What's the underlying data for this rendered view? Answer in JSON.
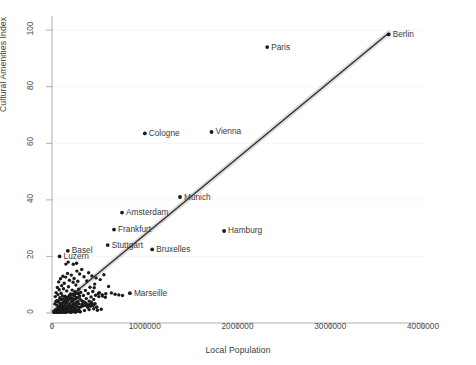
{
  "chart_data": {
    "type": "scatter",
    "title": "",
    "xlabel": "Local Population",
    "ylabel": "Cultural Amenities Index",
    "xlim": [
      0,
      4000000
    ],
    "ylim": [
      0,
      105
    ],
    "xticks": [
      0,
      1000000,
      2000000,
      3000000,
      4000000
    ],
    "xtick_labels": [
      "0",
      "1000000",
      "2000000",
      "3000000",
      "4000000"
    ],
    "yticks": [
      0,
      20,
      40,
      60,
      80,
      100
    ],
    "ytick_labels": [
      "0",
      "20",
      "40",
      "60",
      "80",
      "100"
    ],
    "grid": "horizontal-faint",
    "legend": "none",
    "marker_color": "#1a1a1a",
    "line_color": "#2b2b2b",
    "band_color": "#bfbfbf",
    "fit": {
      "type": "linear-regression-with-confidence-band",
      "x_start": 0,
      "y_start": 0.5,
      "x_end": 3630000,
      "y_end": 99.0
    },
    "labeled_points": [
      {
        "name": "Berlin",
        "x": 3630000,
        "y": 98.5,
        "label_side": "right"
      },
      {
        "name": "Paris",
        "x": 2320000,
        "y": 94.0,
        "label_side": "right"
      },
      {
        "name": "Vienna",
        "x": 1720000,
        "y": 64.0,
        "label_side": "right"
      },
      {
        "name": "Cologne",
        "x": 1000000,
        "y": 63.5,
        "label_side": "right"
      },
      {
        "name": "Munich",
        "x": 1380000,
        "y": 41.0,
        "label_side": "right"
      },
      {
        "name": "Amsterdam",
        "x": 755000,
        "y": 35.5,
        "label_side": "right"
      },
      {
        "name": "Hamburg",
        "x": 1855000,
        "y": 29.0,
        "label_side": "right"
      },
      {
        "name": "Frankfurt",
        "x": 668000,
        "y": 29.5,
        "label_side": "right"
      },
      {
        "name": "Stuttgart",
        "x": 600000,
        "y": 24.0,
        "label_side": "right"
      },
      {
        "name": "Bruxelles",
        "x": 1080000,
        "y": 22.5,
        "label_side": "right"
      },
      {
        "name": "Basel",
        "x": 170000,
        "y": 22.0,
        "label_side": "right"
      },
      {
        "name": "Luzern",
        "x": 82000,
        "y": 20.0,
        "label_side": "right"
      },
      {
        "name": "Marseille",
        "x": 840000,
        "y": 7.0,
        "label_side": "right"
      }
    ],
    "unlabeled_points": [
      [
        25000,
        0.4
      ],
      [
        32000,
        0.6
      ],
      [
        41000,
        0.9
      ],
      [
        48000,
        0.3
      ],
      [
        55000,
        1.2
      ],
      [
        60000,
        0.5
      ],
      [
        66000,
        1.6
      ],
      [
        70000,
        0.8
      ],
      [
        74000,
        2.1
      ],
      [
        80000,
        0.4
      ],
      [
        86000,
        1.1
      ],
      [
        90000,
        2.6
      ],
      [
        95000,
        0.7
      ],
      [
        100000,
        1.9
      ],
      [
        105000,
        3.1
      ],
      [
        110000,
        0.6
      ],
      [
        115000,
        1.4
      ],
      [
        120000,
        2.3
      ],
      [
        125000,
        0.9
      ],
      [
        130000,
        4.0
      ],
      [
        135000,
        1.7
      ],
      [
        140000,
        2.9
      ],
      [
        145000,
        0.5
      ],
      [
        150000,
        1.3
      ],
      [
        155000,
        3.6
      ],
      [
        160000,
        2.2
      ],
      [
        165000,
        1.0
      ],
      [
        170000,
        4.6
      ],
      [
        175000,
        2.7
      ],
      [
        180000,
        1.5
      ],
      [
        185000,
        3.3
      ],
      [
        190000,
        0.8
      ],
      [
        195000,
        2.4
      ],
      [
        200000,
        5.2
      ],
      [
        205000,
        1.8
      ],
      [
        210000,
        3.9
      ],
      [
        215000,
        2.6
      ],
      [
        220000,
        1.1
      ],
      [
        225000,
        4.3
      ],
      [
        230000,
        3.0
      ],
      [
        235000,
        2.0
      ],
      [
        240000,
        6.1
      ],
      [
        245000,
        3.5
      ],
      [
        250000,
        1.6
      ],
      [
        255000,
        4.9
      ],
      [
        260000,
        2.8
      ],
      [
        265000,
        3.7
      ],
      [
        270000,
        5.5
      ],
      [
        275000,
        2.2
      ],
      [
        280000,
        4.1
      ],
      [
        285000,
        6.8
      ],
      [
        290000,
        3.2
      ],
      [
        295000,
        1.9
      ],
      [
        300000,
        5.0
      ],
      [
        310000,
        7.3
      ],
      [
        320000,
        4.4
      ],
      [
        330000,
        2.5
      ],
      [
        340000,
        6.2
      ],
      [
        350000,
        3.8
      ],
      [
        360000,
        8.0
      ],
      [
        370000,
        5.1
      ],
      [
        380000,
        2.9
      ],
      [
        390000,
        6.9
      ],
      [
        400000,
        4.2
      ],
      [
        410000,
        9.1
      ],
      [
        420000,
        5.7
      ],
      [
        430000,
        3.4
      ],
      [
        440000,
        7.6
      ],
      [
        450000,
        4.8
      ],
      [
        460000,
        10.2
      ],
      [
        470000,
        6.3
      ],
      [
        480000,
        2.1
      ],
      [
        36000,
        5.8
      ],
      [
        44000,
        7.2
      ],
      [
        52000,
        4.3
      ],
      [
        58000,
        9.0
      ],
      [
        64000,
        6.5
      ],
      [
        72000,
        11.0
      ],
      [
        78000,
        8.2
      ],
      [
        84000,
        5.4
      ],
      [
        92000,
        12.1
      ],
      [
        98000,
        7.0
      ],
      [
        104000,
        9.7
      ],
      [
        112000,
        6.0
      ],
      [
        118000,
        13.0
      ],
      [
        124000,
        8.6
      ],
      [
        132000,
        10.5
      ],
      [
        138000,
        5.9
      ],
      [
        148000,
        12.7
      ],
      [
        158000,
        7.8
      ],
      [
        168000,
        14.0
      ],
      [
        178000,
        9.3
      ],
      [
        188000,
        11.6
      ],
      [
        198000,
        6.7
      ],
      [
        208000,
        13.4
      ],
      [
        218000,
        8.1
      ],
      [
        228000,
        10.9
      ],
      [
        238000,
        12.2
      ],
      [
        248000,
        7.5
      ],
      [
        258000,
        9.9
      ],
      [
        268000,
        14.8
      ],
      [
        278000,
        11.2
      ],
      [
        288000,
        8.4
      ],
      [
        298000,
        13.8
      ],
      [
        150000,
        17.3
      ],
      [
        175000,
        18.0
      ],
      [
        230000,
        17.2
      ],
      [
        265000,
        17.6
      ],
      [
        320000,
        15.4
      ],
      [
        345000,
        12.8
      ],
      [
        375000,
        11.3
      ],
      [
        395000,
        14.2
      ],
      [
        430000,
        13.1
      ],
      [
        455000,
        8.9
      ],
      [
        475000,
        12.4
      ],
      [
        500000,
        6.9
      ],
      [
        510000,
        7.2
      ],
      [
        520000,
        11.8
      ],
      [
        540000,
        6.5
      ],
      [
        560000,
        13.5
      ],
      [
        580000,
        6.8
      ],
      [
        610000,
        9.4
      ],
      [
        640000,
        7.1
      ],
      [
        680000,
        6.6
      ],
      [
        720000,
        6.4
      ],
      [
        760000,
        6.2
      ],
      [
        300000,
        0.6
      ],
      [
        350000,
        0.9
      ],
      [
        400000,
        1.2
      ],
      [
        450000,
        1.5
      ],
      [
        490000,
        1.0
      ],
      [
        530000,
        1.3
      ],
      [
        20000,
        0.2
      ],
      [
        28000,
        0.3
      ],
      [
        34000,
        0.5
      ],
      [
        38000,
        0.2
      ],
      [
        46000,
        0.4
      ],
      [
        50000,
        0.3
      ],
      [
        56000,
        0.6
      ],
      [
        62000,
        0.2
      ],
      [
        68000,
        0.5
      ],
      [
        76000,
        0.3
      ],
      [
        82000,
        0.7
      ],
      [
        88000,
        0.4
      ],
      [
        94000,
        0.2
      ],
      [
        102000,
        0.6
      ],
      [
        108000,
        0.3
      ],
      [
        114000,
        0.8
      ],
      [
        122000,
        0.4
      ],
      [
        128000,
        0.5
      ],
      [
        136000,
        0.2
      ],
      [
        142000,
        0.7
      ],
      [
        152000,
        0.3
      ],
      [
        162000,
        0.6
      ],
      [
        172000,
        0.4
      ],
      [
        182000,
        0.9
      ],
      [
        192000,
        0.5
      ],
      [
        202000,
        0.2
      ],
      [
        212000,
        0.7
      ],
      [
        222000,
        0.4
      ],
      [
        232000,
        1.0
      ],
      [
        242000,
        0.6
      ],
      [
        252000,
        0.3
      ],
      [
        262000,
        0.8
      ],
      [
        272000,
        0.5
      ],
      [
        282000,
        1.1
      ],
      [
        292000,
        0.7
      ],
      [
        305000,
        0.4
      ],
      [
        315000,
        2.2
      ],
      [
        325000,
        3.1
      ],
      [
        335000,
        4.0
      ],
      [
        355000,
        2.6
      ],
      [
        365000,
        3.5
      ],
      [
        385000,
        2.0
      ],
      [
        405000,
        3.0
      ],
      [
        415000,
        2.4
      ],
      [
        425000,
        3.8
      ],
      [
        445000,
        2.7
      ],
      [
        465000,
        3.3
      ],
      [
        485000,
        2.1
      ],
      [
        505000,
        5.8
      ],
      [
        545000,
        6.0
      ],
      [
        575000,
        5.6
      ],
      [
        30000,
        3.2
      ],
      [
        42000,
        4.1
      ],
      [
        54000,
        2.8
      ],
      [
        67000,
        3.9
      ],
      [
        79000,
        4.6
      ],
      [
        91000,
        3.4
      ],
      [
        106000,
        4.8
      ],
      [
        119000,
        3.7
      ],
      [
        133000,
        5.1
      ],
      [
        146000,
        4.2
      ],
      [
        159000,
        5.6
      ],
      [
        173000,
        4.4
      ],
      [
        186000,
        6.2
      ],
      [
        199000,
        4.9
      ],
      [
        213000,
        5.3
      ],
      [
        227000,
        6.6
      ],
      [
        241000,
        5.0
      ],
      [
        254000,
        6.9
      ],
      [
        269000,
        5.5
      ],
      [
        284000,
        7.1
      ],
      [
        299000,
        6.0
      ]
    ]
  }
}
